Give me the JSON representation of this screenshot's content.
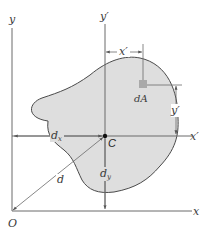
{
  "figure": {
    "colors": {
      "region_fill": "#dedede",
      "region_stroke": "#4a4a4a",
      "axis": "#6a6a6a",
      "dimension": "#6a6a6a",
      "element_dA": "#a9a9a9",
      "centroid": "#111111"
    }
  },
  "labels": {
    "y_axis": "y",
    "x_axis": "x",
    "origin": "O",
    "y_prime_axis": "y′",
    "x_prime_axis": "x′",
    "centroid": "C",
    "element": "dA",
    "x_prime_dim": "x′",
    "y_prime_dim": "y′",
    "dx": "d",
    "dx_sub": "x",
    "dy": "d",
    "dy_sub": "y",
    "d": "d"
  }
}
